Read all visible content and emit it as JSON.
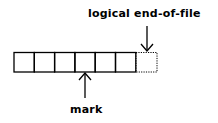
{
  "diagram": {
    "labels": {
      "eof": "logical end-of-file",
      "mark": "mark"
    },
    "cells": {
      "solid_count": 6,
      "dotted_count": 1
    },
    "colors": {
      "stroke": "#000000",
      "background": "#ffffff"
    }
  }
}
